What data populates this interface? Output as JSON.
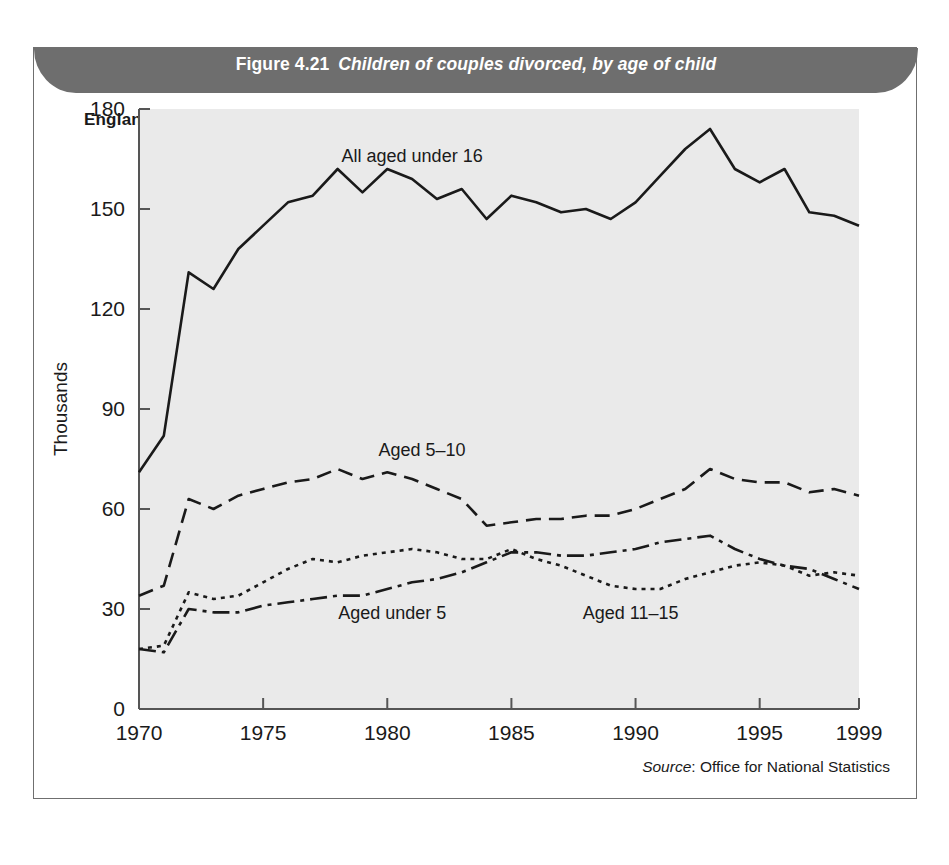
{
  "figure": {
    "number": "Figure 4.21",
    "title": "Children of couples divorced, by age of child",
    "region_subtitle": "England & Wales",
    "source_label": "Source",
    "source_text": ": Office for National Statistics"
  },
  "colors": {
    "title_band": "#6e6e6e",
    "plot_background": "#eaeaea",
    "line": "#1a1a1a",
    "frame_border": "#6f6f6f",
    "axis": "#555555"
  },
  "chart_data": {
    "type": "line",
    "title": "Children of couples divorced, by age of child",
    "subtitle": "England & Wales",
    "xlabel": "",
    "ylabel": "Thousands",
    "xlim": [
      1970,
      1999
    ],
    "ylim": [
      0,
      180
    ],
    "ytick_labels": [
      "0",
      "30",
      "60",
      "90",
      "120",
      "150",
      "180"
    ],
    "yticks": [
      0,
      30,
      60,
      90,
      120,
      150,
      180
    ],
    "xtick_labels": [
      "1970",
      "1975",
      "1980",
      "1985",
      "1990",
      "1995",
      "1999"
    ],
    "xticks": [
      1970,
      1975,
      1980,
      1985,
      1990,
      1995,
      1999
    ],
    "grid": false,
    "legend_position": "inline-annotations",
    "x": [
      1970,
      1971,
      1972,
      1973,
      1974,
      1975,
      1976,
      1977,
      1978,
      1979,
      1980,
      1981,
      1982,
      1983,
      1984,
      1985,
      1986,
      1987,
      1988,
      1989,
      1990,
      1991,
      1992,
      1993,
      1994,
      1995,
      1996,
      1997,
      1998,
      1999
    ],
    "series": [
      {
        "name": "All aged under 16",
        "style": "solid",
        "label_x": 1981.0,
        "label_y": 164,
        "values": [
          71,
          82,
          131,
          126,
          138,
          145,
          152,
          154,
          162,
          155,
          162,
          159,
          153,
          156,
          147,
          154,
          152,
          149,
          150,
          147,
          152,
          160,
          168,
          174,
          162,
          158,
          162,
          149,
          148,
          145
        ]
      },
      {
        "name": "Aged 5–10",
        "style": "dashed",
        "label_x": 1981.4,
        "label_y": 76,
        "values": [
          34,
          37,
          63,
          60,
          64,
          66,
          68,
          69,
          72,
          69,
          71,
          69,
          66,
          63,
          55,
          56,
          57,
          57,
          58,
          58,
          60,
          63,
          66,
          72,
          69,
          68,
          68,
          65,
          66,
          64
        ]
      },
      {
        "name": "Aged under 5",
        "style": "dotted",
        "label_x": 1980.2,
        "label_y": 27,
        "values": [
          18,
          19,
          35,
          33,
          34,
          38,
          42,
          45,
          44,
          46,
          47,
          48,
          47,
          45,
          45,
          48,
          45,
          43,
          40,
          37,
          36,
          36,
          39,
          41,
          43,
          44,
          43,
          40,
          41,
          40
        ]
      },
      {
        "name": "Aged 11–15",
        "style": "dashdot",
        "label_x": 1989.8,
        "label_y": 27,
        "values": [
          18,
          17,
          30,
          29,
          29,
          31,
          32,
          33,
          34,
          34,
          36,
          38,
          39,
          41,
          44,
          47,
          47,
          46,
          46,
          47,
          48,
          50,
          51,
          52,
          48,
          45,
          43,
          42,
          39,
          36
        ]
      }
    ]
  }
}
